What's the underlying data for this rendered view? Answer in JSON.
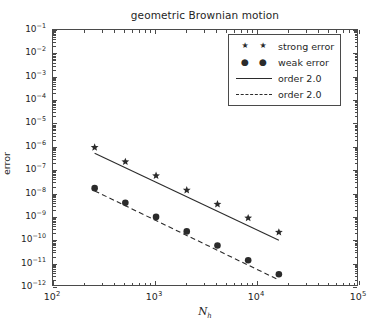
{
  "chart_data": {
    "type": "scatter",
    "title": "geometric Brownian motion",
    "xlabel": "N_h",
    "xlabel_base": "N",
    "xlabel_sub": "h",
    "ylabel": "error",
    "xscale": "log",
    "yscale": "log",
    "xlim": [
      100,
      100000
    ],
    "ylim": [
      1e-12,
      0.1
    ],
    "grid": false,
    "legend_position": "upper right",
    "xticks": [
      100,
      1000,
      10000,
      100000
    ],
    "xtick_labels": [
      "10²",
      "10³",
      "10⁴",
      "10⁵"
    ],
    "xtick_exponents": [
      "2",
      "3",
      "4",
      "5"
    ],
    "ytick_exponents": [
      "-1",
      "-2",
      "-3",
      "-4",
      "-5",
      "-6",
      "-7",
      "-8",
      "-9",
      "-10",
      "-11",
      "-12"
    ],
    "yticks": [
      0.1,
      0.01,
      0.001,
      0.0001,
      1e-05,
      1e-06,
      1e-07,
      1e-08,
      1e-09,
      1e-10,
      1e-11,
      1e-12
    ],
    "series": [
      {
        "name": "strong error",
        "marker": "star",
        "color": "#2b2b2b",
        "x": [
          256,
          512,
          1024,
          2048,
          4096,
          8192,
          16384
        ],
        "y": [
          9.5e-07,
          2.3e-07,
          5.8e-08,
          1.4e-08,
          3.5e-09,
          9e-10,
          2.2e-10
        ]
      },
      {
        "name": "weak error",
        "marker": "circle",
        "color": "#2b2b2b",
        "x": [
          256,
          512,
          1024,
          2048,
          4096,
          8192,
          16384
        ],
        "y": [
          1.7e-08,
          4e-09,
          1e-09,
          2.4e-10,
          6e-11,
          1.4e-11,
          3.5e-12
        ]
      }
    ],
    "reference_lines": [
      {
        "name": "order 2.0",
        "style": "solid",
        "color": "#2b2b2b",
        "x": [
          256,
          16384
        ],
        "y": [
          5.3e-07,
          1e-10
        ]
      },
      {
        "name": "order 2.0",
        "style": "dashed",
        "color": "#2b2b2b",
        "x": [
          256,
          16384
        ],
        "y": [
          1.3e-08,
          2e-12
        ]
      }
    ],
    "legend": [
      {
        "label": "strong error",
        "marker": "star",
        "line": "none"
      },
      {
        "label": "weak error",
        "marker": "circle",
        "line": "none"
      },
      {
        "label": "order 2.0",
        "marker": "none",
        "line": "solid"
      },
      {
        "label": "order 2.0",
        "marker": "none",
        "line": "dashed"
      }
    ]
  }
}
